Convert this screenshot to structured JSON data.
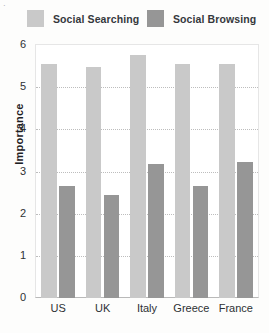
{
  "legend": {
    "position": "top",
    "entries": [
      {
        "label": "Social Searching",
        "color": "#c9c9c9"
      },
      {
        "label": "Social Browsing",
        "color": "#969696"
      }
    ]
  },
  "axes": {
    "ylabel": "Importance",
    "yticks": [
      "0",
      "1",
      "2",
      "3",
      "4",
      "5",
      "6"
    ],
    "xticks": [
      "US",
      "UK",
      "Italy",
      "Greece",
      "France"
    ]
  },
  "chart_data": {
    "type": "bar",
    "title": "",
    "xlabel": "",
    "ylabel": "Importance",
    "categories": [
      "US",
      "UK",
      "Italy",
      "Greece",
      "France"
    ],
    "series": [
      {
        "name": "Social Searching",
        "color": "#c9c9c9",
        "values": [
          5.55,
          5.48,
          5.77,
          5.55,
          5.55
        ]
      },
      {
        "name": "Social Browsing",
        "color": "#969696",
        "values": [
          2.65,
          2.44,
          3.19,
          2.65,
          3.22
        ]
      }
    ],
    "ylim": [
      0,
      6
    ],
    "ytick_step": 1,
    "grid": true,
    "grid_axis": "y",
    "grid_style": "dotted",
    "legend_position": "top"
  }
}
